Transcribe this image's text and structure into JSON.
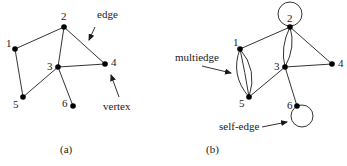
{
  "panels": [
    {
      "id": "a",
      "caption": "(a)",
      "nodes": [
        {
          "id": "1",
          "label": "1"
        },
        {
          "id": "2",
          "label": "2"
        },
        {
          "id": "3",
          "label": "3"
        },
        {
          "id": "4",
          "label": "4"
        },
        {
          "id": "5",
          "label": "5"
        },
        {
          "id": "6",
          "label": "6"
        }
      ],
      "edges": [
        {
          "from": "1",
          "to": "2",
          "count": 1
        },
        {
          "from": "2",
          "to": "3",
          "count": 1
        },
        {
          "from": "2",
          "to": "4",
          "count": 1
        },
        {
          "from": "3",
          "to": "4",
          "count": 1
        },
        {
          "from": "3",
          "to": "5",
          "count": 1
        },
        {
          "from": "3",
          "to": "6",
          "count": 1
        },
        {
          "from": "1",
          "to": "5",
          "count": 1
        }
      ],
      "annotations": [
        {
          "text": "edge",
          "points_to": "edge 2-4"
        },
        {
          "text": "vertex",
          "points_to": "vertex 4"
        }
      ]
    },
    {
      "id": "b",
      "caption": "(b)",
      "nodes": [
        {
          "id": "1",
          "label": "1"
        },
        {
          "id": "2",
          "label": "2"
        },
        {
          "id": "3",
          "label": "3"
        },
        {
          "id": "4",
          "label": "4"
        },
        {
          "id": "5",
          "label": "5"
        },
        {
          "id": "6",
          "label": "6"
        }
      ],
      "edges": [
        {
          "from": "1",
          "to": "2",
          "count": 1
        },
        {
          "from": "2",
          "to": "3",
          "count": 2
        },
        {
          "from": "2",
          "to": "4",
          "count": 1
        },
        {
          "from": "3",
          "to": "4",
          "count": 1
        },
        {
          "from": "3",
          "to": "5",
          "count": 1
        },
        {
          "from": "3",
          "to": "6",
          "count": 1
        },
        {
          "from": "1",
          "to": "5",
          "count": 3
        },
        {
          "from": "2",
          "to": "2",
          "count": 1
        },
        {
          "from": "6",
          "to": "6",
          "count": 1
        }
      ],
      "annotations": [
        {
          "text": "multiedge",
          "points_to": "multiedge 1-5"
        },
        {
          "text": "self-edge",
          "points_to": "self-edge at 6"
        }
      ]
    }
  ]
}
